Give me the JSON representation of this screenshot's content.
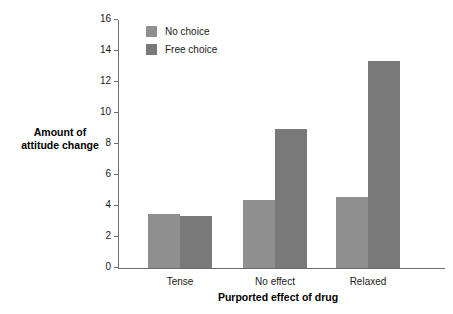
{
  "chart_data": {
    "type": "bar",
    "title": "",
    "xlabel": "Purported effect of drug",
    "ylabel": "Amount of\nattitude change",
    "ylabel_line1": "Amount of",
    "ylabel_line2": "attitude change",
    "categories": [
      "Tense",
      "No effect",
      "Relaxed"
    ],
    "series": [
      {
        "name": "No choice",
        "color": "#8f8f8f",
        "values": [
          3.5,
          4.4,
          4.6
        ]
      },
      {
        "name": "Free choice",
        "color": "#797979",
        "values": [
          3.35,
          9.0,
          13.35
        ]
      }
    ],
    "ylim": [
      0,
      16
    ],
    "ytick_step": 2,
    "yticks": [
      "16",
      "14",
      "12",
      "10",
      "8",
      "6",
      "4",
      "2",
      "0"
    ],
    "ytick_values": [
      16,
      14,
      12,
      10,
      8,
      6,
      4,
      2,
      0
    ],
    "grid": false,
    "legend_position": "top-left-inside",
    "legend": [
      "No choice",
      "Free choice"
    ],
    "axis_color": "#6e6e6e",
    "background": "#ffffff"
  }
}
